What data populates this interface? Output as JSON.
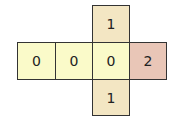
{
  "diagram": {
    "cells": [
      {
        "id": "top",
        "value": "1",
        "x": 92,
        "y": 5,
        "w": 38,
        "h": 38,
        "color": "#f3e6c3"
      },
      {
        "id": "row-0",
        "value": "0",
        "x": 17,
        "y": 42,
        "w": 39,
        "h": 38,
        "color": "#fafac9"
      },
      {
        "id": "row-1",
        "value": "0",
        "x": 55,
        "y": 42,
        "w": 38,
        "h": 38,
        "color": "#fafac9"
      },
      {
        "id": "row-2",
        "value": "0",
        "x": 92,
        "y": 42,
        "w": 38,
        "h": 38,
        "color": "#fafac9"
      },
      {
        "id": "row-3",
        "value": "2",
        "x": 129,
        "y": 42,
        "w": 38,
        "h": 38,
        "color": "#e9c6b7"
      },
      {
        "id": "bottom",
        "value": "1",
        "x": 92,
        "y": 79,
        "w": 38,
        "h": 37,
        "color": "#f3e6c3"
      }
    ]
  }
}
